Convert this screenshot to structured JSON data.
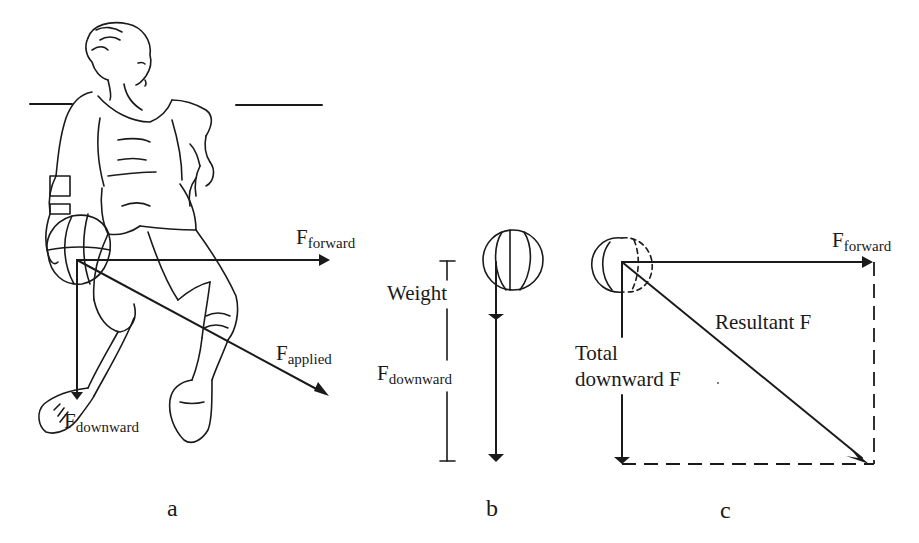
{
  "figure": {
    "panels": [
      {
        "id": "a",
        "label": "a",
        "description": "Basketball player dribbling; force vectors from ball",
        "vectors": [
          {
            "name": "F",
            "subscript": "forward"
          },
          {
            "name": "F",
            "subscript": "applied"
          },
          {
            "name": "F",
            "subscript": "downward"
          }
        ]
      },
      {
        "id": "b",
        "label": "b",
        "description": "Ball with vertical downward force composed of weight and downward force",
        "dimension_labels": [
          {
            "text": "Weight"
          },
          {
            "name": "F",
            "subscript": "downward"
          }
        ]
      },
      {
        "id": "c",
        "label": "c",
        "description": "Vector addition rectangle: forward force and total downward force give resultant",
        "vectors": [
          {
            "name": "F",
            "subscript": "forward"
          },
          {
            "text": "Resultant F"
          },
          {
            "text_line1": "Total",
            "text_line2": "downward F"
          }
        ]
      }
    ]
  },
  "colors": {
    "ink": "#1a1a1a",
    "background": "#ffffff"
  }
}
